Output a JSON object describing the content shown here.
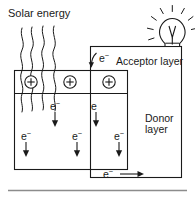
{
  "diagram": {
    "title_text": "Solar energy",
    "labels": {
      "solar_energy": "Solar energy",
      "acceptor_layer": "Acceptor layer",
      "donor_layer_line1": "Donor",
      "donor_layer_line2": "layer"
    },
    "charge_carriers": {
      "positive_symbol": "⊕",
      "positive_count": 3,
      "electron_label": "e",
      "electron_superscript": "−"
    },
    "electron_markers": [
      {
        "id": "acceptor-electron",
        "text": "e",
        "sup": "−",
        "arrow": "curve-up-left"
      },
      {
        "id": "donor-electron-1",
        "text": "e",
        "sup": "−",
        "arrow": "down"
      },
      {
        "id": "donor-electron-2",
        "text": "e",
        "sup": "",
        "arrow": "down"
      },
      {
        "id": "donor-electron-3",
        "text": "e",
        "sup": "−",
        "arrow": "down"
      },
      {
        "id": "donor-electron-4",
        "text": "e",
        "sup": "−",
        "arrow": "down"
      },
      {
        "id": "donor-electron-5",
        "text": "e",
        "sup": "−",
        "arrow": "down"
      },
      {
        "id": "circuit-electron",
        "text": "e",
        "sup": "−",
        "arrow": "right"
      }
    ],
    "icons": {
      "lightbulb": "lightbulb-icon",
      "solar_rays": "wavy-ray-icon",
      "plus_charge": "plus-circle-icon"
    },
    "colors": {
      "stroke": "#1a1a1a",
      "background": "#ffffff",
      "rule": "#8c8c8c"
    },
    "ray_count": 4
  }
}
